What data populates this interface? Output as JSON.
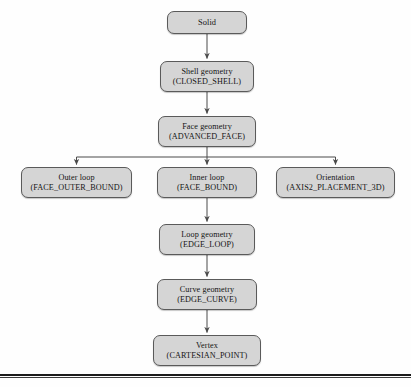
{
  "diagram": {
    "type": "flowchart",
    "background_color": "#fefefe",
    "node_fill_color": "#d5d5d5",
    "node_border_color": "#5a5a5a",
    "connector_color": "#4b4b4b",
    "rule_color": "#1b1b1b",
    "nodes": [
      {
        "id": "solid",
        "name": "Solid",
        "entity": "",
        "x": 167,
        "y": 11,
        "w": 80,
        "h": 23
      },
      {
        "id": "shell-geometry",
        "name": "Shell geometry",
        "entity": "(CLOSED_SHELL)",
        "x": 160,
        "y": 61,
        "w": 94,
        "h": 31
      },
      {
        "id": "face-geometry",
        "name": "Face geometry",
        "entity": "(ADVANCED_FACE)",
        "x": 158,
        "y": 116,
        "w": 98,
        "h": 31
      },
      {
        "id": "outer-loop",
        "name": "Outer loop",
        "entity": "(FACE_OUTER_BOUND)",
        "x": 21,
        "y": 167,
        "w": 111,
        "h": 31
      },
      {
        "id": "inner-loop",
        "name": "Inner loop",
        "entity": "(FACE_BOUND)",
        "x": 157,
        "y": 167,
        "w": 100,
        "h": 31
      },
      {
        "id": "orientation",
        "name": "Orientation",
        "entity": "(AXIS2_PLACEMENT_3D)",
        "x": 276,
        "y": 167,
        "w": 119,
        "h": 31
      },
      {
        "id": "loop-geometry",
        "name": "Loop geometry",
        "entity": "(EDGE_LOOP)",
        "x": 159,
        "y": 224,
        "w": 96,
        "h": 31
      },
      {
        "id": "curve-geometry",
        "name": "Curve geometry",
        "entity": "(EDGE_CURVE)",
        "x": 157,
        "y": 279,
        "w": 100,
        "h": 31
      },
      {
        "id": "vertex",
        "name": "Vertex",
        "entity": "(CARTESIAN_POINT)",
        "x": 153,
        "y": 335,
        "w": 108,
        "h": 31
      }
    ],
    "edges": [
      {
        "from": "solid",
        "to": "shell-geometry",
        "style": "straight-arrow"
      },
      {
        "from": "shell-geometry",
        "to": "face-geometry",
        "style": "straight-arrow"
      },
      {
        "from": "face-geometry",
        "to": "outer-loop",
        "style": "elbow-arrow"
      },
      {
        "from": "face-geometry",
        "to": "inner-loop",
        "style": "straight-arrow"
      },
      {
        "from": "face-geometry",
        "to": "orientation",
        "style": "elbow-arrow"
      },
      {
        "from": "inner-loop",
        "to": "loop-geometry",
        "style": "straight-arrow"
      },
      {
        "from": "loop-geometry",
        "to": "curve-geometry",
        "style": "straight-arrow"
      },
      {
        "from": "curve-geometry",
        "to": "vertex",
        "style": "straight-arrow"
      }
    ],
    "rule": {
      "y": 374,
      "thickness": 2
    }
  }
}
